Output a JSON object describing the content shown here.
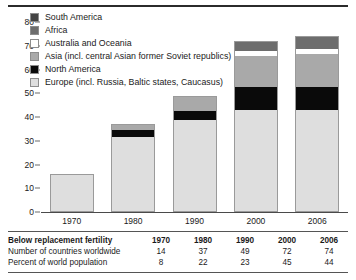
{
  "chart_data": {
    "type": "bar",
    "stacked": true,
    "title": "",
    "subtitle": "",
    "xlabel": "",
    "ylabel": "",
    "grid": false,
    "legend_position": "top-left",
    "categories": [
      "1970",
      "1980",
      "1990",
      "2000",
      "2006"
    ],
    "ylim": [
      0,
      80
    ],
    "yticks": [
      0,
      10,
      20,
      30,
      40,
      50,
      60,
      70,
      80
    ],
    "ytick_labels": [
      "0",
      "10",
      "20",
      "30",
      "40",
      "50",
      "60",
      "70",
      "80"
    ],
    "series": [
      {
        "name": "Europe (incl. Russia, Baltic states, Caucasus)",
        "color": "#dedede",
        "values": [
          16,
          32,
          39,
          43,
          43
        ]
      },
      {
        "name": "North America",
        "color": "#0a0a0a",
        "values": [
          0,
          3,
          4,
          10,
          10
        ]
      },
      {
        "name": "Asia (incl. central Asian former Soviet republics)",
        "color": "#a9a9a9",
        "values": [
          0,
          2,
          6,
          13,
          14
        ]
      },
      {
        "name": "Australia and Oceania",
        "color": "#ffffff",
        "values": [
          0,
          0,
          0,
          2,
          2
        ]
      },
      {
        "name": "Africa",
        "color": "#6d6d6d",
        "values": [
          0,
          0,
          0,
          4,
          5
        ]
      },
      {
        "name": "South America",
        "color": "#444444",
        "values": [
          0,
          0,
          0,
          0,
          0
        ]
      }
    ],
    "totals": [
      16,
      37,
      49,
      72,
      74
    ]
  },
  "legend": {
    "items": [
      {
        "label": "South America",
        "color": "#444444",
        "swatch": "legend-swatch-south-america"
      },
      {
        "label": "Africa",
        "color": "#6d6d6d",
        "swatch": "legend-swatch-africa"
      },
      {
        "label": "Australia and Oceania",
        "color": "#ffffff",
        "swatch": "legend-swatch-australia-oceania"
      },
      {
        "label": "Asia (incl. central Asian former Soviet republics)",
        "color": "#a9a9a9",
        "swatch": "legend-swatch-asia"
      },
      {
        "label": "North America",
        "color": "#0a0a0a",
        "swatch": "legend-swatch-north-america"
      },
      {
        "label": "Europe (incl. Russia, Baltic states, Caucasus)",
        "color": "#dedede",
        "swatch": "legend-swatch-europe"
      }
    ]
  },
  "axis": {
    "y_ticks": [
      "80",
      "70",
      "60",
      "50",
      "40",
      "30",
      "20",
      "10",
      "0"
    ],
    "x_labels": [
      "1970",
      "1980",
      "1990",
      "2000",
      "2006"
    ]
  },
  "table": {
    "rows": [
      {
        "label": "Below replacement fertility",
        "is_header": true,
        "cells": [
          "1970",
          "1980",
          "1990",
          "2000",
          "2006"
        ]
      },
      {
        "label": "Number of countries worldwide",
        "is_header": false,
        "cells": [
          "14",
          "37",
          "49",
          "72",
          "74"
        ]
      },
      {
        "label": "Percent of world population",
        "is_header": false,
        "cells": [
          "8",
          "22",
          "23",
          "45",
          "44"
        ]
      }
    ]
  }
}
